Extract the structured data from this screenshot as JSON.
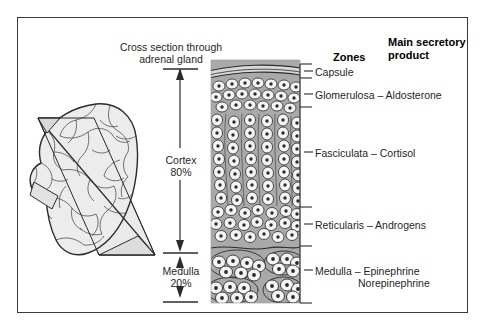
{
  "figure": {
    "kind": "anatomy-diagram",
    "title": {
      "line1": "Cross section through",
      "line2": "adrenal gland"
    },
    "headers": {
      "zones": "Zones",
      "product_line1": "Main secretory",
      "product_line2": "product"
    },
    "brackets": [
      {
        "name": "cortex",
        "label": "Cortex",
        "percent": "80%"
      },
      {
        "name": "medulla",
        "label": "Medulla",
        "percent": "20%"
      }
    ],
    "zone_labels": [
      {
        "name": "capsule",
        "text": "Capsule"
      },
      {
        "name": "glomerulosa",
        "text": "Glomerulosa – Aldosterone"
      },
      {
        "name": "fasciculata",
        "text": "Fasciculata – Cortisol"
      },
      {
        "name": "reticularis",
        "text": "Reticularis – Androgens"
      },
      {
        "name": "medulla",
        "text": "Medulla – Epinephrine"
      },
      {
        "name": "medulla2",
        "text": "Norepinephrine"
      }
    ],
    "colors": {
      "frame": "#3a3a3a",
      "ink": "#2b2b2b",
      "tissue_gray": "#a9a9a9",
      "cell_fill": "#f2f2f2",
      "gland_fill": "#e9e9e9",
      "plane_fill": "#e4e4e4",
      "text": "#1f1f1f"
    }
  }
}
